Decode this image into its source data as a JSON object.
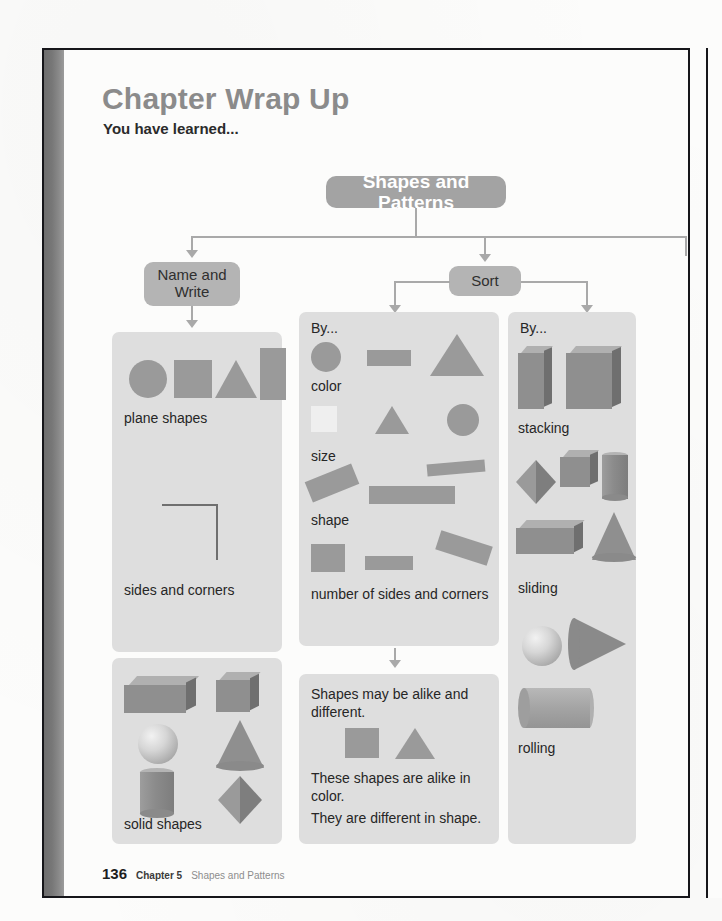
{
  "page": {
    "title": "Chapter Wrap Up",
    "subtitle": "You have learned...",
    "footer": {
      "page_number": "136",
      "chapter": "Chapter 5",
      "chapter_title": "Shapes and Patterns"
    }
  },
  "flow": {
    "root": "Shapes and Patterns",
    "branch_name_write": "Name and\nWrite",
    "branch_name_write_line1": "Name and",
    "branch_name_write_line2": "Write",
    "branch_sort": "Sort"
  },
  "columns": {
    "name_and_write": {
      "groups": [
        {
          "label": "plane shapes",
          "shapes": [
            "circle",
            "square",
            "triangle",
            "rectangle"
          ]
        },
        {
          "label": "sides and corners",
          "shapes": [
            "corner-line-drawing"
          ]
        },
        {
          "label": "solid shapes",
          "shapes": [
            "rectangular-prism",
            "cube",
            "sphere",
            "cone",
            "cylinder",
            "pyramid"
          ]
        }
      ]
    },
    "sort_by_attributes": {
      "heading": "By...",
      "groups": [
        {
          "label": "color",
          "shapes": [
            "circle",
            "rectangle",
            "triangle"
          ]
        },
        {
          "label": "size",
          "shapes": [
            "light-square",
            "small-triangle",
            "circle"
          ]
        },
        {
          "label": "shape",
          "shapes": [
            "tilted-rectangle",
            "rectangle",
            "thin-rectangle"
          ]
        },
        {
          "label": "number of sides and corners",
          "shapes": [
            "square",
            "small-rectangle",
            "tilted-rectangle"
          ]
        }
      ]
    },
    "sort_by_motion": {
      "heading": "By...",
      "groups": [
        {
          "label": "stacking",
          "shapes": [
            "box",
            "cube"
          ]
        },
        {
          "label": "sliding",
          "shapes": [
            "pyramid",
            "cube",
            "cylinder",
            "rectangular-prism",
            "cone"
          ]
        },
        {
          "label": "rolling",
          "shapes": [
            "sphere",
            "cone-sideways",
            "cylinder-horizontal"
          ]
        }
      ]
    }
  },
  "alike_box": {
    "line1": "Shapes may be alike and",
    "line2": "different.",
    "line3": "These shapes are alike in",
    "line4": "color.",
    "line5": "They are different in shape.",
    "shapes": [
      "square",
      "triangle"
    ]
  },
  "colors": {
    "panel": "#dedede",
    "shape": "#9a9a9a",
    "node": "#b4b4b4",
    "root_node": "#a3a3a3",
    "connector": "#a9a9a9",
    "title": "#8b8b8b",
    "text": "#262626",
    "spine": "#777777"
  }
}
